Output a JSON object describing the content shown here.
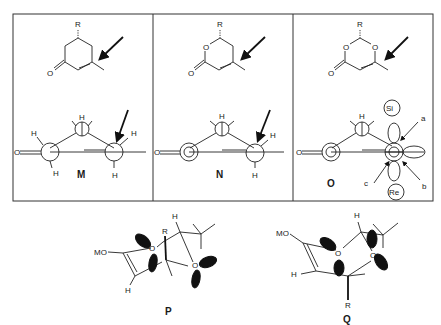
{
  "figure": {
    "type": "chemistry-diagram",
    "panels": [
      {
        "id": "M",
        "label": "M",
        "top_structure": {
          "substituent": "R",
          "carbonyl_atom": "O",
          "ring": "cyclohexenone"
        },
        "newman": {
          "atoms": [
            "O",
            "H",
            "H",
            "H",
            "H",
            "H"
          ],
          "arrow": "attack-arrow"
        }
      },
      {
        "id": "N",
        "label": "N",
        "top_structure": {
          "substituent": "R",
          "ring_oxygen": "O",
          "carbonyl_atom": "O",
          "ring": "dihydropyranone"
        },
        "newman": {
          "atoms": [
            "O",
            "H",
            "H",
            "H"
          ],
          "arrow": "attack-arrow"
        }
      },
      {
        "id": "O",
        "label": "O",
        "top_structure": {
          "substituent": "R",
          "ring_oxygens": [
            "O",
            "O"
          ],
          "carbonyl_atom": "O",
          "ring": "dioxinone"
        },
        "newman": {
          "atoms": [
            "O",
            "H"
          ],
          "face_top": "Si",
          "face_bottom": "Re",
          "trajectories": [
            "a",
            "b",
            "c"
          ]
        }
      }
    ],
    "bottom": [
      {
        "id": "P",
        "label": "P",
        "atoms": {
          "mo": "MO",
          "h1": "H",
          "h2": "H",
          "r": "R",
          "o1": "O",
          "o2": "O"
        }
      },
      {
        "id": "Q",
        "label": "Q",
        "atoms": {
          "mo": "MO",
          "h1": "H",
          "h2": "H",
          "r": "R",
          "o1": "O",
          "o2": "O"
        }
      }
    ],
    "text": {
      "R": "R",
      "O": "O",
      "H": "H",
      "MO": "MO",
      "Si": "Si",
      "Re": "Re",
      "a": "a",
      "b": "b",
      "c": "c",
      "M": "M",
      "N": "N",
      "Olbl": "O",
      "P": "P",
      "Q": "Q"
    }
  }
}
